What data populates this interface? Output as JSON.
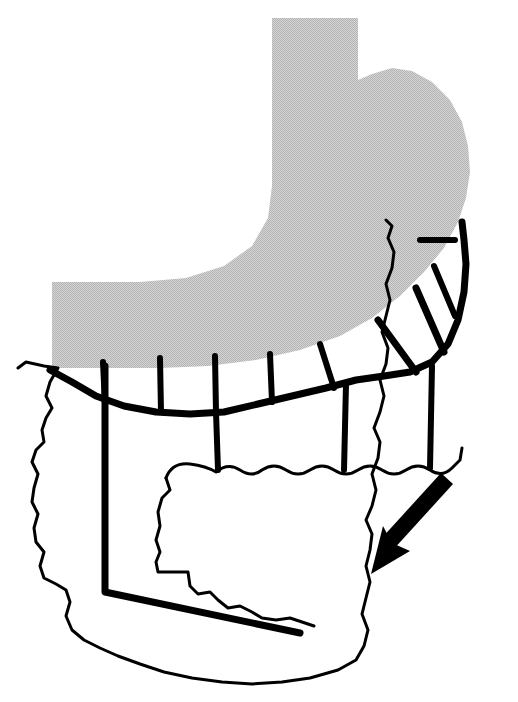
{
  "figure": {
    "caption": "",
    "width": 518,
    "height": 702,
    "background_color": "#ffffff"
  },
  "palette": {
    "organ_gray": "#c9c9c9",
    "ink_black": "#000000",
    "paper_white": "#ffffff"
  },
  "structures": {
    "stomach": {
      "label": "stomach",
      "fill_color": "#c9c9c9",
      "description": "shaded stomach body and fundus, esophageal column at top",
      "path": "M 272 18 L 358 18 L 358 80 L 372 74 L 392 68 L 412 71 L 432 82 L 450 100 L 462 122 L 468 146 L 470 172 L 466 198 L 458 222 L 444 248 L 424 272 L 400 296 L 372 318 L 340 336 L 300 350 L 256 360 L 208 366 L 160 368 L 104 368 L 52 368 L 52 282 L 140 282 L 186 278 L 224 266 L 252 246 L 268 218 L 272 186 Z"
    },
    "omentum_outer": {
      "label": "greater omentum outer border",
      "stroke_color": "#000000",
      "stroke_width": 3,
      "path": "M 18 368 L 26 362 L 44 366 L 58 368 L 50 382 L 46 396 L 52 408 L 46 418 L 42 430 L 44 442 L 36 450 L 32 462 L 38 474 L 34 488 L 32 502 L 38 514 L 34 528 L 36 542 L 44 552 L 40 566 L 44 578 L 56 584 L 66 590 L 70 602 L 66 616 L 72 630 L 84 640 L 100 648 L 118 656 L 140 664 L 164 672 L 192 678 L 222 682 L 252 684 L 282 682 L 310 678 L 338 670 L 356 660 L 364 646 L 368 630 L 362 614 L 366 598 L 370 582 L 366 566 L 370 550 L 372 534 L 366 520 L 372 506 L 376 490 L 372 474 L 378 458 L 380 442 L 374 428 L 380 412 L 384 396 L 380 380 L 386 364 L 388 348 L 382 332 L 386 316 L 390 300 L 386 284 L 392 268 L 394 252 L 388 238 L 392 226 L 386 220"
    },
    "omentum_inner_flap": {
      "label": "reflected omental flap with scalloped edge",
      "stroke_color": "#000000",
      "stroke_width": 3,
      "path": "M 166 478 Q 172 462 190 464 Q 206 466 216 472 Q 228 462 240 470 Q 252 478 262 470 Q 274 462 286 470 Q 298 478 310 470 Q 322 462 334 470 Q 346 478 358 470 Q 370 462 382 470 Q 394 478 406 470 Q 418 462 430 470 Q 442 478 452 468 L 460 460 L 462 448"
    },
    "omentum_flap_left": {
      "label": "left jagged edge of reflected flap",
      "stroke_color": "#000000",
      "stroke_width": 3,
      "path": "M 166 478 L 170 490 L 162 498 L 158 512 L 160 526 L 156 540 L 160 552 L 156 562 L 158 572 L 188 572 L 190 586 L 198 594 L 210 592 L 218 600 L 228 608 L 240 606 L 252 612 L 262 618 L 276 620 L 290 618 L 302 622 L 314 626"
    },
    "vessels": {
      "gastroepiploic_arcade": {
        "label": "gastroepiploic arcade",
        "stroke_color": "#000000",
        "stroke_width": 7,
        "path": "M 50 370 L 72 382 L 96 396 L 124 406 L 156 412 L 190 414 L 224 412 L 258 404 L 292 396 L 326 388 L 356 380 L 384 376 L 410 372 L 432 362 L 448 344 L 458 320 L 464 292 L 466 264 L 464 240 L 462 222"
      },
      "branches_to_stomach": {
        "label": "omental branches to greater curvature",
        "stroke_color": "#000000",
        "stroke_width": 6,
        "paths": [
          "M 103 362 L 105 404",
          "M 160 358 L 161 412",
          "M 215 356 L 216 412",
          "M 270 354 L 272 402",
          "M 320 344 L 334 388",
          "M 378 320 L 416 372",
          "M 416 288 L 444 352",
          "M 434 266 L 455 316",
          "M 455 240 L 420 240"
        ]
      },
      "branches_to_omentum": {
        "label": "descending omental branches",
        "stroke_color": "#000000",
        "stroke_width": 6,
        "paths": [
          "M 216 412 L 218 470",
          "M 346 384 L 344 470",
          "M 432 366 L 430 468"
        ]
      },
      "long_left_vessel": {
        "label": "long dissected omental vessel",
        "stroke_color": "#000000",
        "stroke_width": 7,
        "path": "M 105 366 L 105 592 L 300 633"
      }
    },
    "traction_arrow": {
      "label": "traction direction arrow",
      "fill_color": "#000000",
      "direction": "down-left",
      "tail": [
        444,
        476
      ],
      "head": [
        372,
        574
      ],
      "path": "M 444 476 L 452 486 L 396 552 L 414 556 L 372 574 L 382 530 L 390 544 Z"
    }
  }
}
